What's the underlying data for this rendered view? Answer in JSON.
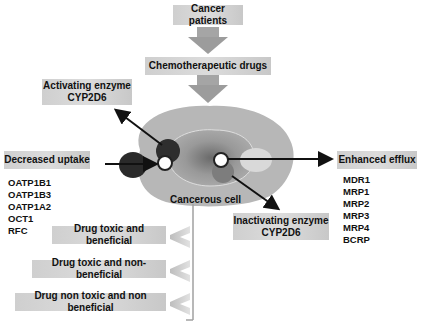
{
  "diagram": {
    "top_boxes": {
      "patients": "Cancer patients",
      "drugs": "Chemotherapeutic drugs"
    },
    "cell_label": "Cancerous cell",
    "activating": {
      "line1": "Activating enzyme",
      "line2": "CYP2D6"
    },
    "inactivating": {
      "line1": "Inactivating enzyme",
      "line2": "CYP2D6"
    },
    "uptake": {
      "label": "Decreased uptake",
      "transporters": [
        "OATP1B1",
        "OATP1B3",
        "OATP1A2",
        "OCT1",
        "RFC"
      ]
    },
    "efflux": {
      "label": "Enhanced efflux",
      "transporters": [
        "MDR1",
        "MRP1",
        "MRP2",
        "MRP3",
        "MRP4",
        "BCRP"
      ]
    },
    "outcomes": [
      "Drug toxic and beneficial",
      "Drug toxic and non-beneficial",
      "Drug non toxic and non beneficial"
    ],
    "colors": {
      "box_fill": "#d4d4d4",
      "cell_outer": "#b5b5b5",
      "cell_inner": "#9a9a9a",
      "arrow_gray": "#9c9c9c",
      "dark_circle": "#2a2a2a"
    }
  }
}
